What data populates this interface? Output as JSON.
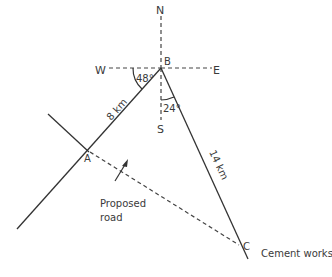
{
  "diagram": {
    "compass": {
      "north": "N",
      "south": "S",
      "east": "E",
      "west": "W"
    },
    "points": {
      "A": {
        "label": "A"
      },
      "B": {
        "label": "B"
      },
      "C": {
        "label": "C",
        "caption": "Cement works"
      }
    },
    "angles": {
      "west_to_BA": "48°",
      "south_to_BC": "24°"
    },
    "distances": {
      "BA": "8 km",
      "BC": "14 km"
    },
    "proposed_road": {
      "line1": "Proposed",
      "line2": "road"
    },
    "colors": {
      "line": "#333333",
      "text": "#3a3a3a",
      "background": "#ffffff"
    }
  }
}
